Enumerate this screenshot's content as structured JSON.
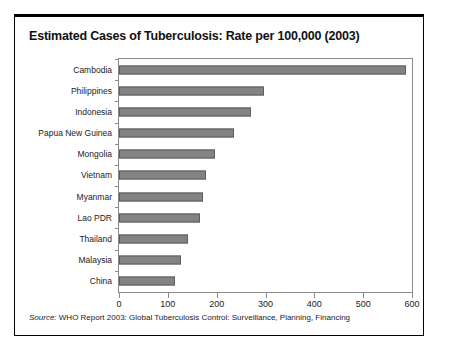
{
  "chart_data": {
    "type": "bar",
    "orientation": "horizontal",
    "title": "Estimated Cases of Tuberculosis: Rate per 100,000 (2003)",
    "xlabel": "",
    "ylabel": "",
    "xlim": [
      0,
      600
    ],
    "xticks": [
      0,
      100,
      200,
      300,
      400,
      500,
      600
    ],
    "xtick_labels": [
      "0",
      "100",
      "200",
      "300",
      "400",
      "500",
      "600"
    ],
    "grid": false,
    "legend": null,
    "bar_color": "#838383",
    "bar_edge_color": "#5d5d5d",
    "categories": [
      "Cambodia",
      "Philippines",
      "Indonesia",
      "Papua New Guinea",
      "Mongolia",
      "Vietnam",
      "Myanmar",
      "Lao PDR",
      "Thailand",
      "Malaysia",
      "China"
    ],
    "values": [
      588,
      296,
      271,
      236,
      196,
      178,
      171,
      165,
      142,
      126,
      115
    ]
  },
  "source": {
    "prefix": "Source:",
    "text": " WHO Report 2003: Global Tuberculosis Control: Surveillance, Planning, Financing"
  }
}
